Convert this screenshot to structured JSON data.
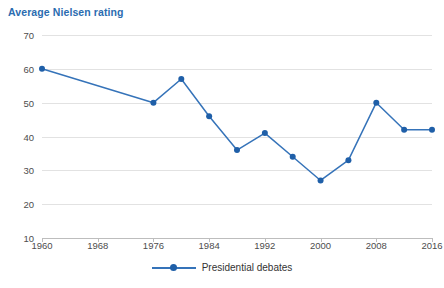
{
  "chart_data": {
    "type": "line",
    "title": "Average Nielsen rating",
    "xlabel": "",
    "ylabel": "",
    "grid": true,
    "legend_position": "bottom-center",
    "xlim": [
      1960,
      2016
    ],
    "ylim": [
      10,
      70
    ],
    "ytick_labels": [
      "70",
      "60",
      "50",
      "40",
      "30",
      "20",
      "10"
    ],
    "ytick_values": [
      70,
      60,
      50,
      40,
      30,
      20,
      10
    ],
    "xtick_labels": [
      "1960",
      "1968",
      "1976",
      "1984",
      "1992",
      "2000",
      "2008",
      "2016"
    ],
    "xtick_values": [
      1960,
      1968,
      1976,
      1984,
      1992,
      2000,
      2008,
      2016
    ],
    "series": [
      {
        "name": "Presidential debates",
        "color": "#3573b9",
        "marker_color": "#1f5fa8",
        "x": [
          1960,
          1976,
          1980,
          1984,
          1988,
          1992,
          1996,
          2000,
          2004,
          2008,
          2012,
          2016
        ],
        "values": [
          60,
          50,
          57,
          46,
          36,
          41,
          34,
          27,
          33,
          50,
          42,
          42
        ]
      }
    ]
  },
  "legend": {
    "entries": [
      {
        "label": "Presidential debates"
      }
    ]
  },
  "colors": {
    "title": "#2b6cb0",
    "line": "#3573b9",
    "marker": "#1f5fa8",
    "grid": "#e2e2e2",
    "axis": "#bdbdbd",
    "tick_text": "#4d4d4d"
  }
}
